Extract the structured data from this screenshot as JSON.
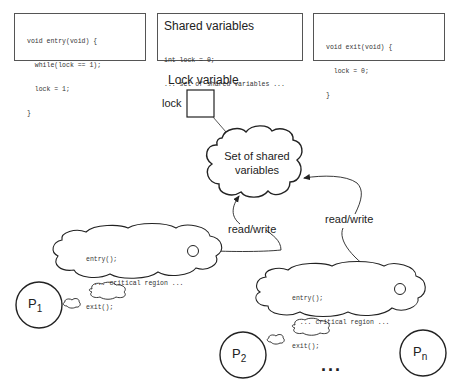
{
  "boxes": {
    "entry": {
      "lines": [
        "void entry(void) {",
        "  while(lock == 1);",
        "  lock = 1;",
        "}"
      ]
    },
    "shared": {
      "title": "Shared variables",
      "lines": [
        "int lock = 0;",
        "... set of shared variables ..."
      ]
    },
    "exit": {
      "lines": [
        "void exit(void) {",
        "  lock = 0;",
        "}"
      ]
    }
  },
  "lock": {
    "title": "Lock variable",
    "label": "lock"
  },
  "shared_cloud": {
    "line1": "Set of shared",
    "line2": "variables"
  },
  "arrows": {
    "left_label": "read/write",
    "right_label": "read/write"
  },
  "thought_left": {
    "lines": [
      "entry();",
      "  ... critical region ...",
      "exit();"
    ]
  },
  "thought_right": {
    "lines": [
      "entry();",
      "  ... critical region ...",
      "exit();"
    ]
  },
  "processes": {
    "p1": {
      "base": "P",
      "sub": "1"
    },
    "p2": {
      "base": "P",
      "sub": "2"
    },
    "pn": {
      "base": "P",
      "sub": "n"
    },
    "ellipsis": "..."
  }
}
